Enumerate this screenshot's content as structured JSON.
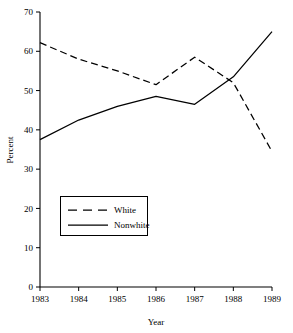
{
  "chart_data": {
    "type": "line",
    "title": "",
    "xlabel": "Year",
    "ylabel": "Percent",
    "categories": [
      "1983",
      "1984",
      "1985",
      "1986",
      "1987",
      "1988",
      "1989"
    ],
    "x": [
      1983,
      1984,
      1985,
      1986,
      1987,
      1988,
      1989
    ],
    "xlim": [
      1983,
      1989
    ],
    "ylim": [
      0,
      70
    ],
    "yticks": [
      0,
      10,
      20,
      30,
      40,
      50,
      60,
      70
    ],
    "ytick_labels": [
      "0",
      "10",
      "20",
      "30",
      "40",
      "50",
      "60",
      "70"
    ],
    "grid": false,
    "legend_position": "lower-left-inside",
    "series": [
      {
        "name": "White",
        "style": "dashed",
        "color": "#000000",
        "values": [
          62.2,
          58.0,
          55.0,
          51.5,
          58.5,
          52.0,
          34.5
        ]
      },
      {
        "name": "Nonwhite",
        "style": "solid",
        "color": "#000000",
        "values": [
          37.5,
          42.5,
          46.0,
          48.5,
          46.5,
          53.5,
          65.0
        ]
      }
    ]
  },
  "axes": {
    "y_label": "Percent",
    "x_label": "Year"
  },
  "legend": {
    "entries": [
      {
        "label": "White",
        "style": "dashed"
      },
      {
        "label": "Nonwhite",
        "style": "solid"
      }
    ]
  }
}
